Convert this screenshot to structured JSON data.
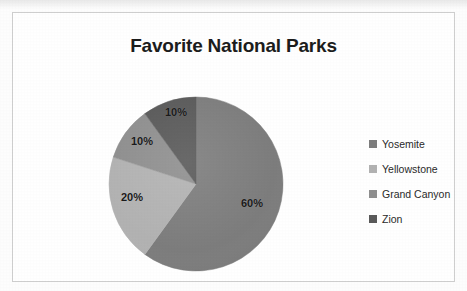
{
  "chart_data": {
    "type": "pie",
    "title": "Favorite National Parks",
    "categories": [
      "Yosemite",
      "Yellowstone",
      "Grand Canyon",
      "Zion"
    ],
    "values": [
      60,
      20,
      10,
      10
    ],
    "data_labels": [
      "60%",
      "20%",
      "10%",
      "10%"
    ],
    "unit": "%",
    "colors": [
      "#7d7d7d",
      "#b2b2b2",
      "#8f8f8f",
      "#5a5a5a"
    ],
    "legend_position": "right",
    "grid": false,
    "start_angle_deg": 0,
    "direction": "clockwise"
  },
  "chart": {
    "title": "Favorite National Parks",
    "slices": [
      {
        "label": "Yosemite",
        "data_label": "60%",
        "value": 60,
        "color": "#7d7d7d"
      },
      {
        "label": "Yellowstone",
        "data_label": "20%",
        "value": 20,
        "color": "#b2b2b2"
      },
      {
        "label": "Grand Canyon",
        "data_label": "10%",
        "value": 10,
        "color": "#8f8f8f"
      },
      {
        "label": "Zion",
        "data_label": "10%",
        "value": 10,
        "color": "#5a5a5a"
      }
    ]
  },
  "legend": {
    "items": [
      {
        "label": "Yosemite",
        "color": "#7d7d7d"
      },
      {
        "label": "Yellowstone",
        "color": "#b2b2b2"
      },
      {
        "label": "Grand Canyon",
        "color": "#8f8f8f"
      },
      {
        "label": "Zion",
        "color": "#5a5a5a"
      }
    ]
  }
}
